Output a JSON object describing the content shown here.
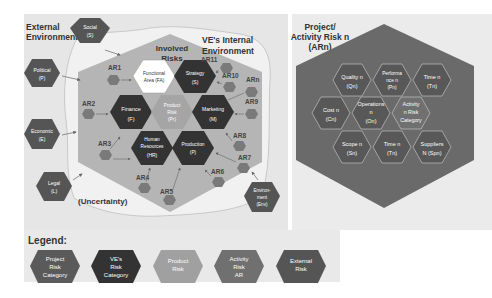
{
  "left_panel": {
    "external_title_line1": "External",
    "external_title_line2": "Environment",
    "internal_title_line1": "VE's Internal",
    "internal_title_line2": "Environment",
    "involved_line1": "Involved",
    "involved_line2": "Risks",
    "uncertainty": "(Uncertainty)",
    "external_risks": [
      {
        "line1": "Social",
        "line2": "(S)"
      },
      {
        "line1": "Political",
        "line2": "(P)"
      },
      {
        "line1": "Economic",
        "line2": "(E)"
      },
      {
        "line1": "Legal",
        "line2": "(L)"
      },
      {
        "line1": "Environ-",
        "line2": "ment",
        "line3": "(Env)"
      }
    ],
    "ve_risks": [
      {
        "line1": "Functional",
        "line2": "Area (FA)"
      },
      {
        "line1": "Strategy",
        "line2": "(S)"
      },
      {
        "line1": "Finance",
        "line2": "(F)"
      },
      {
        "line1": "Product",
        "line2": "Risk",
        "line3": "(Pr)"
      },
      {
        "line1": "Marketing",
        "line2": "(M)"
      },
      {
        "line1": "Human",
        "line2": "Resources",
        "line3": "(HR)"
      },
      {
        "line1": "Production",
        "line2": "(P)"
      }
    ],
    "activity_risks": [
      "AR1",
      "AR2",
      "AR3",
      "AR4",
      "AR5",
      "AR6",
      "AR7",
      "AR8",
      "AR9",
      "ARn",
      "AR10",
      "AR11"
    ]
  },
  "right_panel": {
    "title_line1": "Project/",
    "title_line2": "Activity Risk n",
    "title_line3": "(ARn)",
    "cells": [
      {
        "line1": "Quality n",
        "line2": "(Qn)"
      },
      {
        "line1": "Performa",
        "line2": "nce n",
        "line3": "(Pn)"
      },
      {
        "line1": "Time n",
        "line2": "(Tn)"
      },
      {
        "line1": "Cost n",
        "line2": "(Cn)"
      },
      {
        "line1": "Operations",
        "line2": "n",
        "line3": "(On)"
      },
      {
        "line1": "Activity",
        "line2": "n Risk",
        "line3": "Category"
      },
      {
        "line1": "Scope n",
        "line2": "(Sn)"
      },
      {
        "line1": "Time n",
        "line2": "(Tn)"
      },
      {
        "line1": "Suppliers",
        "line2": "N (Spn)"
      }
    ]
  },
  "legend": {
    "title": "Legend:",
    "items": [
      {
        "line1": "Project",
        "line2": "Risk",
        "line3": "Category",
        "color": "#5a5a5a"
      },
      {
        "line1": "VE's",
        "line2": "Risk",
        "line3": "Category",
        "color": "#3a3a3a"
      },
      {
        "line1": "Product",
        "line2": "Risk",
        "line3": "",
        "color": "#a0a0a0"
      },
      {
        "line1": "Activity",
        "line2": "Risk",
        "line3": "AR",
        "color": "#707070"
      },
      {
        "line1": "External",
        "line2": "Risk",
        "line3": "",
        "color": "#555555"
      }
    ]
  },
  "colors": {
    "panel_bg": "#e6e6e6",
    "internal_hex": "#b8b8b8",
    "ve_dark": "#333333",
    "product": "#a5a5a5",
    "external": "#555555",
    "activity": "#7a7a7a",
    "project_big": "#6b6b6b",
    "project_cell": "#5a5a5a"
  }
}
